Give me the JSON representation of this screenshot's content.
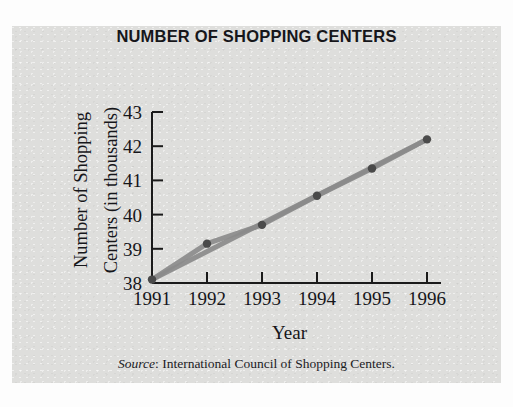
{
  "figure": {
    "title": "NUMBER OF SHOPPING CENTERS",
    "x_axis_title": "Year",
    "y_axis_title_line_1": "Number of Shopping",
    "y_axis_title_line_2": "Centers (in thousands)",
    "source_label": "Source",
    "source_text": ": International Council of Shopping Centers.",
    "panel_color": "#dededc",
    "line_color": "#8b8b8b",
    "marker_color": "#4a4a4a",
    "axis_color": "#1a1a1a"
  },
  "chart_data": {
    "type": "line",
    "title": "NUMBER OF SHOPPING CENTERS",
    "xlabel": "Year",
    "ylabel": "Number of Shopping Centers (in thousands)",
    "categories": [
      "1991",
      "1992",
      "1993",
      "1994",
      "1995",
      "1996"
    ],
    "x": [
      1991,
      1992,
      1993,
      1994,
      1995,
      1996
    ],
    "values": [
      38.1,
      39.15,
      39.7,
      40.55,
      41.35,
      42.2
    ],
    "series": [
      {
        "name": "Number of Shopping Centers (in thousands)",
        "values": [
          38.1,
          39.15,
          39.7,
          40.55,
          41.35,
          42.2
        ]
      }
    ],
    "ylim": [
      38,
      43
    ],
    "xlim": [
      1991,
      1996
    ],
    "ytick_labels": [
      "43",
      "42",
      "41",
      "40",
      "39",
      "38"
    ],
    "yticks": [
      43,
      42,
      41,
      40,
      39,
      38
    ],
    "xtick_labels": [
      "1991",
      "1992",
      "1993",
      "1994",
      "1995",
      "1996"
    ],
    "grid": false,
    "legend": "none",
    "markers": true,
    "annotations": [
      "Source: International Council of Shopping Centers."
    ]
  }
}
